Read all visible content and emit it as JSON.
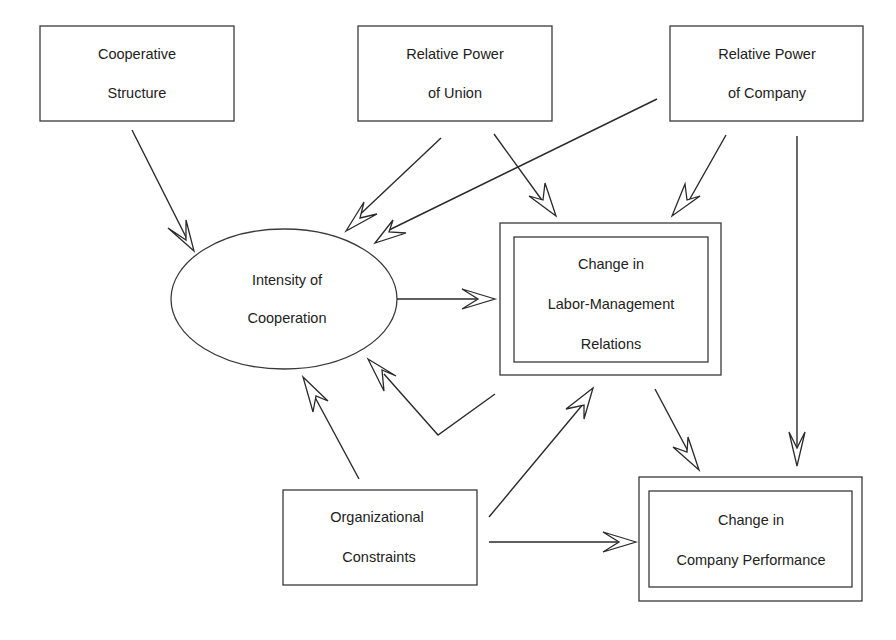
{
  "diagram": {
    "type": "causal-model",
    "nodes": {
      "cooperative_structure": {
        "line1": "Cooperative",
        "line2": "Structure",
        "shape": "box"
      },
      "relative_power_union": {
        "line1": "Relative Power",
        "line2": "of Union",
        "shape": "box"
      },
      "relative_power_company": {
        "line1": "Relative Power",
        "line2": "of Company",
        "shape": "box"
      },
      "intensity_of_cooperation": {
        "line1": "Intensity of",
        "line2": "Cooperation",
        "shape": "ellipse"
      },
      "change_labor_management": {
        "line1": "Change in",
        "line2": "Labor-Management",
        "line3": "Relations",
        "shape": "double-box"
      },
      "organizational_constraints": {
        "line1": "Organizational",
        "line2": "Constraints",
        "shape": "box"
      },
      "change_company_performance": {
        "line1": "Change in",
        "line2": "Company Performance",
        "shape": "double-box"
      }
    },
    "edges": [
      {
        "from": "Cooperative Structure",
        "to": "Intensity of Cooperation"
      },
      {
        "from": "Relative Power of Union",
        "to": "Intensity of Cooperation"
      },
      {
        "from": "Relative Power of Union",
        "to": "Change in Labor-Management Relations"
      },
      {
        "from": "Relative Power of Company",
        "to": "Intensity of Cooperation"
      },
      {
        "from": "Relative Power of Company",
        "to": "Change in Labor-Management Relations"
      },
      {
        "from": "Relative Power of Company",
        "to": "Change in Company Performance"
      },
      {
        "from": "Intensity of Cooperation",
        "to": "Change in Labor-Management Relations"
      },
      {
        "from": "Change in Labor-Management Relations",
        "to": "Intensity of Cooperation"
      },
      {
        "from": "Change in Labor-Management Relations",
        "to": "Change in Company Performance"
      },
      {
        "from": "Organizational Constraints",
        "to": "Intensity of Cooperation"
      },
      {
        "from": "Organizational Constraints",
        "to": "Change in Labor-Management Relations"
      },
      {
        "from": "Organizational Constraints",
        "to": "Change in Company Performance"
      }
    ]
  }
}
